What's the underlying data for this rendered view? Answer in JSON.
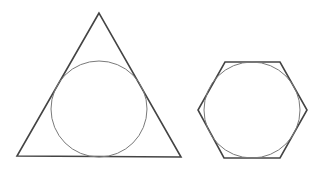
{
  "figure": {
    "width": 324,
    "height": 169,
    "background": "#ffffff",
    "shapes": [
      {
        "id": "triangle",
        "type": "polygon",
        "points": "99,13 17,156 181,157",
        "stroke": "#444444",
        "stroke_width": 1.6
      },
      {
        "id": "triangle-incircle",
        "type": "circle",
        "cx": 99,
        "cy": 109,
        "r": 48,
        "stroke": "#7a7a7a",
        "stroke_width": 1.0
      },
      {
        "id": "hexagon",
        "type": "polygon",
        "points": "225,62 280,62 307,110 280,158 224,158 198,110",
        "stroke": "#444444",
        "stroke_width": 1.6
      },
      {
        "id": "hexagon-incircle",
        "type": "circle",
        "cx": 252,
        "cy": 110,
        "r": 48,
        "stroke": "#7a7a7a",
        "stroke_width": 1.0
      }
    ]
  }
}
